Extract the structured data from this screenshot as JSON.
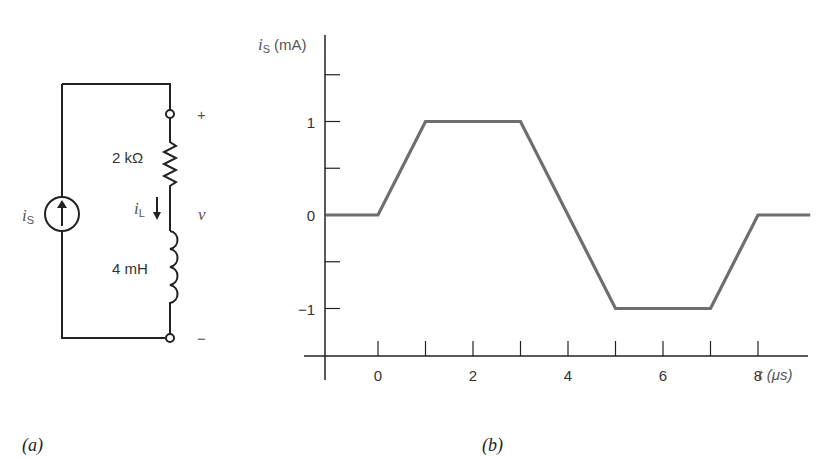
{
  "circuit": {
    "source_label": "i",
    "source_sub": "S",
    "resistor_label": "2 kΩ",
    "inductor_label": "4 mH",
    "current_label": "i",
    "current_sub": "L",
    "voltage_label": "v",
    "plus": "+",
    "minus": "−",
    "caption": "(a)"
  },
  "chart_data": {
    "type": "line",
    "title": "",
    "ylabel": "i",
    "ylabel_sub": "S",
    "ylabel_unit": "(mA)",
    "xlabel": "t",
    "xlabel_unit": "(μs)",
    "x": [
      -1.1,
      0,
      1,
      3,
      5,
      7,
      8,
      9.1
    ],
    "series": [
      {
        "name": "i_S",
        "values": [
          0,
          0,
          1,
          1,
          -1,
          -1,
          0,
          0
        ]
      }
    ],
    "xlim": [
      -1.1,
      9.6
    ],
    "ylim": [
      -1.5,
      1.75
    ],
    "xticks": [
      0,
      1,
      2,
      3,
      4,
      5,
      6,
      7,
      8
    ],
    "xtick_labels": [
      "0",
      "",
      "2",
      "",
      "4",
      "",
      "6",
      "",
      "8"
    ],
    "yticks": [
      1.5,
      1,
      0.5,
      0,
      -0.5,
      -1
    ],
    "ytick_labels": [
      "",
      "1",
      "",
      "0",
      "",
      "-1"
    ],
    "grid": false,
    "caption": "(b)"
  }
}
